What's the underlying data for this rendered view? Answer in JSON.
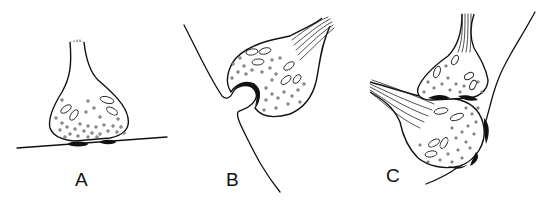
{
  "figure": {
    "type": "line-drawing",
    "panels": [
      {
        "id": "A",
        "label": "A",
        "description": "Bouton resting on a flat postsynaptic membrane with two dark synaptic thickenings"
      },
      {
        "id": "B",
        "label": "B",
        "description": "Bouton with a postsynaptic spine-like protrusion invaginating into it"
      },
      {
        "id": "C",
        "label": "C",
        "description": "Axo-axonic arrangement: one bouton synapsing on another bouton which contacts a curved postsynaptic membrane"
      }
    ],
    "colors": {
      "ink": "#111111",
      "background": "#ffffff"
    }
  }
}
